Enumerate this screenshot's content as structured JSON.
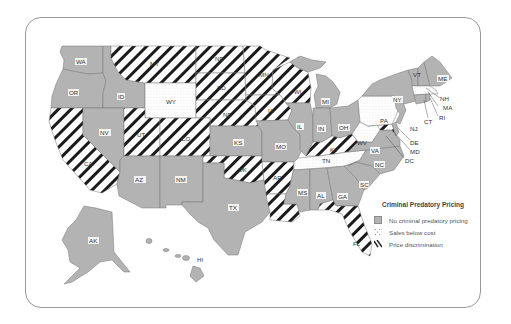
{
  "map": {
    "title": "Criminal Predatory Pricing",
    "categories": {
      "none": {
        "label": "No criminal predatory pricing",
        "fill": "#b3b3b3",
        "pattern": "solid"
      },
      "below_cost": {
        "label": "Sales below cost",
        "fill": "#ffffff",
        "pattern": "dots"
      },
      "discrimination": {
        "label": "Price discrimination",
        "fill": "#ffffff",
        "pattern": "diagonal-stripes"
      }
    },
    "states": [
      {
        "code": "WA",
        "category": "none"
      },
      {
        "code": "OR",
        "category": "none"
      },
      {
        "code": "ID",
        "category": "none"
      },
      {
        "code": "MT",
        "category": "discrimination"
      },
      {
        "code": "WY",
        "category": "below_cost"
      },
      {
        "code": "ND",
        "category": "discrimination"
      },
      {
        "code": "SD",
        "category": "discrimination"
      },
      {
        "code": "NE",
        "category": "discrimination"
      },
      {
        "code": "MN",
        "category": "discrimination"
      },
      {
        "code": "WI",
        "category": "discrimination"
      },
      {
        "code": "IA",
        "category": "discrimination"
      },
      {
        "code": "CA",
        "category": "discrimination"
      },
      {
        "code": "NV",
        "category": "none"
      },
      {
        "code": "UT",
        "category": "discrimination"
      },
      {
        "code": "CO",
        "category": "discrimination"
      },
      {
        "code": "AZ",
        "category": "none"
      },
      {
        "code": "NM",
        "category": "none"
      },
      {
        "code": "KS",
        "category": "none"
      },
      {
        "code": "OK",
        "category": "discrimination"
      },
      {
        "code": "TX",
        "category": "none"
      },
      {
        "code": "MO",
        "category": "none"
      },
      {
        "code": "AR",
        "category": "discrimination"
      },
      {
        "code": "LA",
        "category": "discrimination"
      },
      {
        "code": "IL",
        "category": "none"
      },
      {
        "code": "MI",
        "category": "none"
      },
      {
        "code": "IN",
        "category": "none"
      },
      {
        "code": "OH",
        "category": "none"
      },
      {
        "code": "KY",
        "category": "discrimination"
      },
      {
        "code": "TN",
        "category": "below_cost"
      },
      {
        "code": "MS",
        "category": "none"
      },
      {
        "code": "AL",
        "category": "none"
      },
      {
        "code": "GA",
        "category": "none"
      },
      {
        "code": "FL",
        "category": "discrimination"
      },
      {
        "code": "SC",
        "category": "none"
      },
      {
        "code": "NC",
        "category": "none"
      },
      {
        "code": "VA",
        "category": "none"
      },
      {
        "code": "WV",
        "category": "below_cost"
      },
      {
        "code": "PA",
        "category": "below_cost"
      },
      {
        "code": "NY",
        "category": "none"
      },
      {
        "code": "VT",
        "category": "none"
      },
      {
        "code": "NH",
        "category": "none"
      },
      {
        "code": "ME",
        "category": "none"
      },
      {
        "code": "MA",
        "category": "below_cost"
      },
      {
        "code": "RI",
        "category": "none"
      },
      {
        "code": "CT",
        "category": "none"
      },
      {
        "code": "NJ",
        "category": "none"
      },
      {
        "code": "DE",
        "category": "none"
      },
      {
        "code": "MD",
        "category": "discrimination"
      },
      {
        "code": "DC",
        "category": "none"
      },
      {
        "code": "AK",
        "category": "none"
      },
      {
        "code": "HI",
        "category": "none"
      }
    ],
    "labels": {
      "WA": "WA",
      "OR": "OR",
      "ID": "ID",
      "MT": "MT",
      "WY": "WY",
      "ND": "ND",
      "SD": "SD",
      "NE": "NE",
      "MN": "MN",
      "WI": "WI",
      "IA": "IA",
      "CA": "CA",
      "NV": "NV",
      "UT": "UT",
      "CO": "CO",
      "AZ": "AZ",
      "NM": "NM",
      "KS": "KS",
      "OK": "OK",
      "TX": "TX",
      "MO": "MO",
      "AR": "AR",
      "IL": "IL",
      "MI": "MI",
      "IN": "IN",
      "OH": "OH",
      "KY": "KY",
      "TN": "TN",
      "MS": "MS",
      "AL": "AL",
      "GA": "GA",
      "FL": "FL",
      "SC": "SC",
      "NC": "NC",
      "VA": "VA",
      "WV": "WV",
      "PA": "PA",
      "NY": "NY",
      "VT": "VT",
      "NH": "NH",
      "ME": "ME",
      "MA": "MA",
      "RI": "RI",
      "CT": "CT",
      "NJ": "NJ",
      "DE": "DE",
      "MD": "MD",
      "DC": "DC",
      "AK": "AK",
      "HI": "HI",
      "LA": "LA"
    }
  }
}
